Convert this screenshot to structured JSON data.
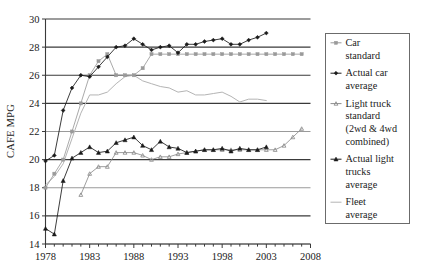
{
  "chart_data": {
    "type": "line",
    "title": "",
    "xlabel": "",
    "ylabel": "CAFE MPG",
    "xlim": [
      1978,
      2008
    ],
    "ylim": [
      14,
      30
    ],
    "xticks": [
      1978,
      1983,
      1988,
      1993,
      1998,
      2003,
      2008
    ],
    "xtick_labels": [
      "1978",
      "1983",
      "1988",
      "1993",
      "1998",
      "2003",
      "2008"
    ],
    "yticks": [
      14,
      16,
      18,
      20,
      22,
      24,
      26,
      28,
      30
    ],
    "ytick_labels": [
      "14",
      "16",
      "18",
      "20",
      "22",
      "24",
      "26",
      "28",
      "30"
    ],
    "grid": "horizontal",
    "minor_xticks_every": 1,
    "legend_position": "right-outside",
    "series": [
      {
        "name": "Car standard",
        "color": "#9a9a9a",
        "marker": "square-small",
        "x": [
          1978,
          1979,
          1980,
          1981,
          1982,
          1983,
          1984,
          1985,
          1986,
          1987,
          1988,
          1989,
          1990,
          1991,
          1992,
          1993,
          1994,
          1995,
          1996,
          1997,
          1998,
          1999,
          2000,
          2001,
          2002,
          2003,
          2004,
          2005,
          2006,
          2007
        ],
        "values": [
          18.0,
          19.0,
          20.0,
          22.0,
          24.0,
          26.0,
          27.0,
          27.5,
          26.0,
          26.0,
          26.0,
          26.5,
          27.5,
          27.5,
          27.5,
          27.5,
          27.5,
          27.5,
          27.5,
          27.5,
          27.5,
          27.5,
          27.5,
          27.5,
          27.5,
          27.5,
          27.5,
          27.5,
          27.5,
          27.5
        ]
      },
      {
        "name": "Actual car average",
        "color": "#1a1a1a",
        "marker": "diamond-filled",
        "x": [
          1978,
          1979,
          1980,
          1981,
          1982,
          1983,
          1984,
          1985,
          1986,
          1987,
          1988,
          1989,
          1990,
          1991,
          1992,
          1993,
          1994,
          1995,
          1996,
          1997,
          1998,
          1999,
          2000,
          2001,
          2002,
          2003
        ],
        "values": [
          19.9,
          20.3,
          23.5,
          25.1,
          26.0,
          25.9,
          26.6,
          27.3,
          28.0,
          28.1,
          28.6,
          28.2,
          27.8,
          28.0,
          28.1,
          27.6,
          28.2,
          28.2,
          28.4,
          28.5,
          28.6,
          28.2,
          28.2,
          28.5,
          28.7,
          29.0
        ]
      },
      {
        "name": "Light truck standard (2wd & 4wd combined)",
        "color": "#8c8c8c",
        "marker": "triangle-small",
        "x": [
          1982,
          1983,
          1984,
          1985,
          1986,
          1987,
          1988,
          1989,
          1990,
          1991,
          1992,
          1993,
          1994,
          1995,
          1996,
          1997,
          1998,
          1999,
          2000,
          2001,
          2002,
          2003,
          2004,
          2005,
          2006,
          2007
        ],
        "values": [
          17.5,
          19.0,
          19.5,
          19.5,
          20.5,
          20.5,
          20.5,
          20.3,
          20.0,
          20.2,
          20.2,
          20.4,
          20.5,
          20.6,
          20.7,
          20.7,
          20.7,
          20.7,
          20.7,
          20.7,
          20.7,
          20.7,
          20.7,
          21.0,
          21.6,
          22.2
        ]
      },
      {
        "name": "Actual light trucks average",
        "color": "#1a1a1a",
        "marker": "triangle-filled",
        "x": [
          1978,
          1979,
          1980,
          1981,
          1982,
          1983,
          1984,
          1985,
          1986,
          1987,
          1988,
          1989,
          1990,
          1991,
          1992,
          1993,
          1994,
          1995,
          1996,
          1997,
          1998,
          1999,
          2000,
          2001,
          2002,
          2003
        ],
        "values": [
          15.1,
          14.7,
          18.5,
          20.1,
          20.5,
          20.9,
          20.5,
          20.6,
          21.2,
          21.4,
          21.6,
          21.0,
          20.7,
          21.3,
          20.9,
          20.8,
          20.5,
          20.6,
          20.7,
          20.7,
          20.8,
          20.6,
          20.8,
          20.7,
          20.7,
          20.9
        ]
      },
      {
        "name": "Fleet average",
        "color": "#b4b4b4",
        "marker": "none",
        "x": [
          1978,
          1979,
          1980,
          1981,
          1982,
          1983,
          1984,
          1985,
          1986,
          1987,
          1988,
          1989,
          1990,
          1991,
          1992,
          1993,
          1994,
          1995,
          1996,
          1997,
          1998,
          1999,
          2000,
          2001,
          2002,
          2003
        ],
        "values": [
          18.2,
          18.8,
          19.7,
          21.5,
          23.3,
          24.6,
          24.6,
          24.8,
          25.4,
          25.9,
          26.0,
          25.6,
          25.4,
          25.2,
          25.1,
          24.8,
          24.9,
          24.6,
          24.6,
          24.7,
          24.8,
          24.5,
          24.1,
          24.3,
          24.3,
          24.2
        ]
      }
    ]
  },
  "legend": {
    "items": [
      {
        "label_line1": "Car",
        "label_line2": "standard",
        "label_line3": "",
        "label_line4": ""
      },
      {
        "label_line1": "Actual car",
        "label_line2": "average",
        "label_line3": "",
        "label_line4": ""
      },
      {
        "label_line1": "Light truck",
        "label_line2": "standard",
        "label_line3": "(2wd & 4wd",
        "label_line4": "combined)"
      },
      {
        "label_line1": "Actual light",
        "label_line2": "trucks",
        "label_line3": "average",
        "label_line4": ""
      },
      {
        "label_line1": "Fleet",
        "label_line2": "average",
        "label_line3": "",
        "label_line4": ""
      }
    ]
  }
}
